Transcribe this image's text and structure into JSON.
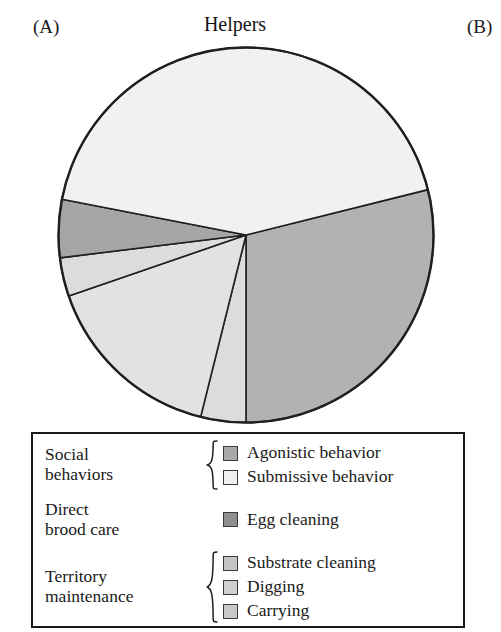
{
  "panels": {
    "a_label": "(A)",
    "b_label": "(B)"
  },
  "chart_data": {
    "type": "pie",
    "title": "Helpers",
    "xlabel": "",
    "ylabel": "",
    "legend_position": "bottom",
    "grid": false,
    "categories": [
      "Agonistic behavior",
      "Submissive behavior",
      "Egg cleaning",
      "Substrate cleaning",
      "Digging",
      "Carrying"
    ],
    "values": [
      29,
      44,
      5,
      16,
      3,
      3
    ],
    "slices": [
      {
        "name": "Agonistic behavior",
        "group": "Social behaviors",
        "percent": 29,
        "color": "#b2b2b2",
        "start_angle": 346,
        "end_angle": 450
      },
      {
        "name": "Carrying",
        "group": "Territory maintenance",
        "percent": 3,
        "color": "#dcdcdc",
        "start_angle": 90,
        "end_angle": 104
      },
      {
        "name": "Substrate cleaning",
        "group": "Territory maintenance",
        "percent": 16,
        "color": "#e2e2e2",
        "start_angle": 104,
        "end_angle": 161
      },
      {
        "name": "Digging",
        "group": "Territory maintenance",
        "percent": 3,
        "color": "#dcdcdc",
        "start_angle": 161,
        "end_angle": 173
      },
      {
        "name": "Egg cleaning",
        "group": "Direct brood care",
        "percent": 5,
        "color": "#a6a6a6",
        "start_angle": 173,
        "end_angle": 191
      },
      {
        "name": "Submissive behavior",
        "group": "Social behaviors",
        "percent": 44,
        "color": "#f1f1f1",
        "start_angle": 191,
        "end_angle": 346
      }
    ]
  },
  "legend": {
    "groups": [
      {
        "label": "Social\nbehaviors",
        "label_line1": "Social",
        "label_line2": "behaviors",
        "brace": true,
        "entries": [
          {
            "label": "Agonistic behavior",
            "color": "#a9a9a9"
          },
          {
            "label": "Submissive behavior",
            "color": "#f0f0f0"
          }
        ]
      },
      {
        "label_line1": "Direct",
        "label_line2": "brood care",
        "brace": false,
        "entries": [
          {
            "label": "Egg cleaning",
            "color": "#8f8f8f"
          }
        ]
      },
      {
        "label_line1": "Territory",
        "label_line2": "maintenance",
        "brace": true,
        "entries": [
          {
            "label": "Substrate cleaning",
            "color": "#c4c4c4"
          },
          {
            "label": "Digging",
            "color": "#cfcfcf"
          },
          {
            "label": "Carrying",
            "color": "#c9c9c9"
          }
        ]
      }
    ]
  }
}
